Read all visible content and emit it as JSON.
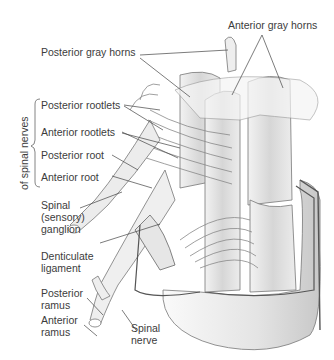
{
  "diagram": {
    "labels": {
      "anterior_gray_horns": "Anterior gray horns",
      "posterior_gray_horns": "Posterior gray horns",
      "posterior_rootlets": "Posterior rootlets",
      "anterior_rootlets": "Anterior rootlets",
      "posterior_root": "Posterior root",
      "anterior_root": "Anterior root",
      "spinal_ganglion_1": "Spinal",
      "spinal_ganglion_2": "(sensory)",
      "spinal_ganglion_3": "ganglion",
      "denticulate_1": "Denticulate",
      "denticulate_2": "ligament",
      "posterior_ramus_1": "Posterior",
      "posterior_ramus_2": "ramus",
      "anterior_ramus_1": "Anterior",
      "anterior_ramus_2": "ramus",
      "spinal_nerve_1": "Spinal",
      "spinal_nerve_2": "nerve"
    },
    "bracket_label": "of spinal nerves",
    "colors": {
      "line": "#4a4a4a",
      "tissue": "#e2e2e2",
      "shade": "#bdbdbd",
      "outline": "#6a6a6a"
    }
  }
}
